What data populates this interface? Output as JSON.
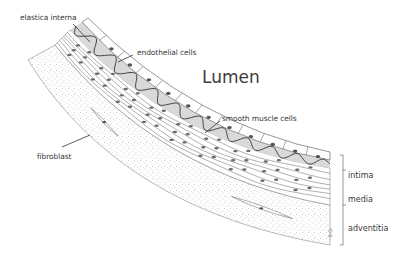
{
  "diagram": {
    "title": "Lumen",
    "labels": {
      "elastica_interna": "elastica interna",
      "endothelial_cells": "endothelial cells",
      "smooth_muscle_cells": "smooth muscle cells",
      "fibroblast": "fibroblast"
    },
    "layers": [
      {
        "name": "intima"
      },
      {
        "name": "media"
      },
      {
        "name": "adventitia"
      }
    ],
    "signature": "S.G.",
    "colors": {
      "line": "#4a4a4a",
      "stroke_light": "#8a8a8a",
      "intima_fill": "#d9d9d9",
      "nucleus": "#6a6a6a",
      "stipple": "#9a9a9a",
      "text": "#3a3a3a"
    }
  }
}
